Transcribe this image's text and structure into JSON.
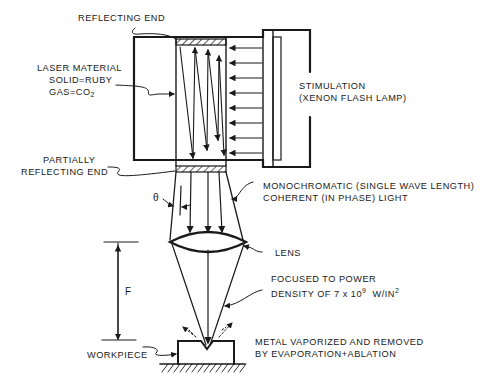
{
  "diagram": {
    "labels": {
      "reflecting_end": "REFLECTING END",
      "laser_material": "LASER MATERIAL",
      "solid": "SOLID=RUBY",
      "gas_prefix": "GAS=CO",
      "gas_sub": "2",
      "stimulation": "STIMULATION",
      "flash_lamp": "(XENON FLASH LAMP)",
      "partially_1": "PARTIALLY",
      "partially_2": "REFLECTING END",
      "theta": "θ",
      "mono_1": "MONOCHROMATIC (SINGLE WAVE LENGTH)",
      "mono_2": "COHERENT (IN PHASE) LIGHT",
      "lens": "LENS",
      "focal_length": "F",
      "focus_1": "FOCUSED TO POWER",
      "focus_2_prefix": "DENSITY OF 7 x 10",
      "focus_2_exp": "9",
      "focus_2_unit": "W/IN",
      "focus_2_unit_exp": "2",
      "workpiece": "WORKPIECE",
      "metal_1": "METAL VAPORIZED AND REMOVED",
      "metal_2": "BY EVAPORATION+ABLATION"
    },
    "colors": {
      "ink": "#1a1a1a",
      "background": "#ffffff"
    }
  }
}
